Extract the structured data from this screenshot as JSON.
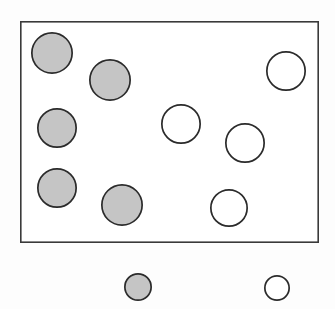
{
  "figure": {
    "name": "set-of-shaded-and-unshaded-circles-with-legend",
    "canvas": {
      "width": 335,
      "height": 309,
      "background": "#fdfdfd"
    },
    "colors": {
      "shaded_fill": "#c5c5c5",
      "unshaded_fill": "#ffffff",
      "circle_stroke": "#2b2b2b",
      "box_stroke": "#3a3a3a"
    },
    "box": {
      "label": "",
      "x": 20,
      "y": 21,
      "width": 299,
      "height": 222,
      "stroke": "#3a3a3a",
      "stroke_width": 1.6,
      "fill": "#ffffff"
    },
    "inside_counts": {
      "shaded": 5,
      "unshaded": 5,
      "total": 10
    },
    "legend_counts": {
      "shaded": 1,
      "unshaded": 1,
      "total": 2
    },
    "circles_inside": [
      {
        "id": "shaded-1",
        "type": "shaded",
        "cx": 52,
        "cy": 53,
        "r": 21
      },
      {
        "id": "shaded-2",
        "type": "shaded",
        "cx": 110,
        "cy": 80,
        "r": 21
      },
      {
        "id": "shaded-3",
        "type": "shaded",
        "cx": 57,
        "cy": 128,
        "r": 20
      },
      {
        "id": "shaded-4",
        "type": "shaded",
        "cx": 57,
        "cy": 188,
        "r": 20
      },
      {
        "id": "shaded-5",
        "type": "shaded",
        "cx": 122,
        "cy": 205,
        "r": 21
      },
      {
        "id": "unshaded-1",
        "type": "unshaded",
        "cx": 286,
        "cy": 71,
        "r": 20
      },
      {
        "id": "unshaded-2",
        "type": "unshaded",
        "cx": 181,
        "cy": 124,
        "r": 20
      },
      {
        "id": "unshaded-3",
        "type": "unshaded",
        "cx": 245,
        "cy": 143,
        "r": 20
      },
      {
        "id": "unshaded-4",
        "type": "unshaded",
        "cx": 229,
        "cy": 208,
        "r": 19
      }
    ],
    "circles_legend": [
      {
        "id": "legend-shaded",
        "type": "shaded",
        "cx": 138,
        "cy": 287,
        "r": 14,
        "label": ""
      },
      {
        "id": "legend-unshaded",
        "type": "unshaded",
        "cx": 277,
        "cy": 288,
        "r": 13,
        "label": ""
      }
    ]
  },
  "chart_data": {
    "type": "scatter",
    "title": "",
    "xlabel": "",
    "ylabel": "",
    "grid": false,
    "legend_position": "below-plot",
    "axis_ranges": {
      "x": [
        0,
        335
      ],
      "y": [
        0,
        309
      ]
    },
    "annotations": [],
    "categories": [
      "shaded",
      "unshaded"
    ],
    "values": [
      5,
      5
    ],
    "series": [
      {
        "name": "shaded",
        "marker": "filled-circle",
        "fill": "#c5c5c5",
        "stroke": "#2b2b2b",
        "count": 5,
        "points": [
          {
            "x": 52,
            "y": 53,
            "r": 21
          },
          {
            "x": 110,
            "y": 80,
            "r": 21
          },
          {
            "x": 57,
            "y": 128,
            "r": 20
          },
          {
            "x": 57,
            "y": 188,
            "r": 20
          },
          {
            "x": 122,
            "y": 205,
            "r": 21
          }
        ]
      },
      {
        "name": "unshaded",
        "marker": "open-circle",
        "fill": "#ffffff",
        "stroke": "#2b2b2b",
        "count": 5,
        "points": [
          {
            "x": 286,
            "y": 71,
            "r": 20
          },
          {
            "x": 181,
            "y": 124,
            "r": 20
          },
          {
            "x": 245,
            "y": 143,
            "r": 20
          },
          {
            "x": 229,
            "y": 208,
            "r": 19
          }
        ]
      }
    ]
  }
}
